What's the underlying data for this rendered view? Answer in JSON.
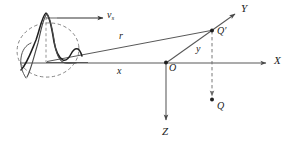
{
  "figure": {
    "type": "physics-coordinate-diagram",
    "background_color": "#ffffff",
    "line_color": "#4a4a4a",
    "curve_color": "#2b2b2b",
    "dash_color": "#6a6a6a",
    "text_color": "#1a1a1a"
  },
  "axes": [
    {
      "name": "x-axis",
      "label": "X",
      "direction": "right",
      "label_x": 274,
      "label_y": 56,
      "from": [
        20,
        63
      ],
      "to": [
        268,
        63
      ]
    },
    {
      "name": "y-axis",
      "label": "Y",
      "direction": "up-right",
      "label_x": 242,
      "label_y": 5,
      "from": [
        166,
        63
      ],
      "to": [
        236,
        15
      ]
    },
    {
      "name": "z-axis",
      "label": "Z",
      "direction": "down",
      "label_x": 162,
      "label_y": 128,
      "from": [
        166,
        63
      ],
      "to": [
        166,
        122
      ]
    }
  ],
  "points": [
    {
      "name": "origin",
      "label": "O",
      "label_x": 169,
      "label_y": 64,
      "x": 166,
      "y": 63
    },
    {
      "name": "field-point-q-prime",
      "label": "Q",
      "prime": "′",
      "label_x": 218,
      "label_y": 27,
      "x": 212,
      "y": 30
    },
    {
      "name": "projected-point-q",
      "label": "Q",
      "label_x": 217,
      "label_y": 102,
      "x": 212,
      "y": 100
    }
  ],
  "vectors": [
    {
      "name": "source-velocity",
      "label": "v",
      "subscript": "s",
      "label_x": 108,
      "label_y": 12,
      "from": [
        56,
        18
      ],
      "to": [
        100,
        18
      ]
    }
  ],
  "segments": [
    {
      "name": "distance-r",
      "label": "r",
      "label_x": 119,
      "label_y": 32,
      "from": [
        48,
        62
      ],
      "to": [
        212,
        30
      ]
    },
    {
      "name": "distance-x",
      "label": "x",
      "label_x": 118,
      "label_y": 67,
      "from": [
        48,
        63
      ],
      "to": [
        166,
        63
      ]
    },
    {
      "name": "distance-y",
      "label": "y",
      "label_x": 196,
      "label_y": 45,
      "from": [
        166,
        63
      ],
      "to": [
        212,
        30
      ]
    }
  ],
  "source": {
    "name": "moving-pulse",
    "description": "Sharp-peaked acoustic pulse waveform enclosed in a dashed ellipse, representing the compact moving source region.",
    "peak_x": 46,
    "peak_y": 14,
    "ellipse_cx": 48,
    "ellipse_cy": 50,
    "ellipse_rx": 31,
    "ellipse_ry": 27
  },
  "connectors": [
    {
      "name": "qprime-to-q-dashed",
      "from": [
        212,
        30
      ],
      "to": [
        212,
        98
      ],
      "style": "dashed"
    },
    {
      "name": "source-box-vertical-dashed",
      "from": [
        46,
        18
      ],
      "to": [
        46,
        62
      ],
      "style": "dashed"
    }
  ]
}
